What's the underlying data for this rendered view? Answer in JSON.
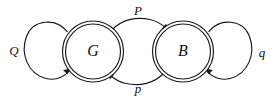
{
  "diagram": {
    "type": "state-transition-diagram",
    "background_color": "#ffffff",
    "stroke_color": "#1a1a1a",
    "states": [
      {
        "id": "G",
        "label": "G",
        "shape": "double-circle",
        "cx": 93,
        "cy": 51.5,
        "r_outer": 30.5,
        "r_inner": 27.5
      },
      {
        "id": "B",
        "label": "B",
        "shape": "double-circle",
        "cx": 183,
        "cy": 51.5,
        "r_outer": 30.5,
        "r_inner": 27.5
      }
    ],
    "transitions": [
      {
        "id": "G-self",
        "label": "Q",
        "from": "G",
        "to": "G",
        "kind": "self-loop",
        "side": "left",
        "label_x": 14,
        "label_y": 52
      },
      {
        "id": "G-to-B",
        "label": "P",
        "from": "G",
        "to": "B",
        "kind": "arc",
        "side": "top",
        "label_x": 138,
        "label_y": 12
      },
      {
        "id": "B-to-G",
        "label": "p",
        "from": "B",
        "to": "G",
        "kind": "arc",
        "side": "bottom",
        "label_x": 138,
        "label_y": 90
      },
      {
        "id": "B-self",
        "label": "q",
        "from": "B",
        "to": "B",
        "kind": "self-loop",
        "side": "right",
        "label_x": 262,
        "label_y": 54
      }
    ]
  }
}
